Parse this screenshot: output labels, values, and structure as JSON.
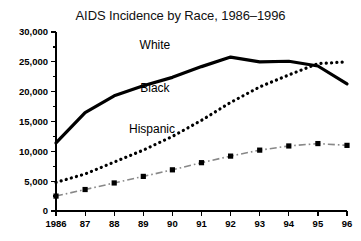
{
  "chart_data": {
    "type": "line",
    "title": "AIDS Incidence by Race, 1986–1996",
    "xlabel": "",
    "ylabel": "",
    "grid": false,
    "legend_position": "inline-labels",
    "categories": [
      "1986",
      "87",
      "88",
      "89",
      "90",
      "91",
      "92",
      "93",
      "94",
      "95",
      "96"
    ],
    "x": [
      1986,
      1987,
      1988,
      1989,
      1990,
      1991,
      1992,
      1993,
      1994,
      1995,
      1996
    ],
    "xlim": [
      1986,
      1996
    ],
    "ylim": [
      0,
      30000
    ],
    "ytick_labels": [
      "30,000",
      "25,000",
      "20,000",
      "15,000",
      "10,000",
      "5,000",
      "0"
    ],
    "ytick_values": [
      30000,
      25000,
      20000,
      15000,
      10000,
      5000,
      0
    ],
    "series": [
      {
        "name": "White",
        "style": "solid",
        "color": "#000000",
        "values": [
          11400,
          16500,
          19300,
          21000,
          22400,
          24200,
          25800,
          25000,
          25100,
          24300,
          21300
        ]
      },
      {
        "name": "Black",
        "style": "dotted",
        "color": "#000000",
        "values": [
          4800,
          6200,
          8200,
          10200,
          12500,
          15200,
          18200,
          20800,
          22800,
          24700,
          25000
        ]
      },
      {
        "name": "Hispanic",
        "style": "dash-dot",
        "color": "#333333",
        "values": [
          2500,
          3600,
          4700,
          5800,
          6900,
          8100,
          9200,
          10200,
          10900,
          11300,
          11000
        ]
      }
    ],
    "annotations": [
      {
        "text": "White",
        "x": 1989.4,
        "y": 27200
      },
      {
        "text": "Black",
        "x": 1989.4,
        "y": 20000
      },
      {
        "text": "Hispanic",
        "x": 1989.3,
        "y": 13000
      }
    ]
  }
}
